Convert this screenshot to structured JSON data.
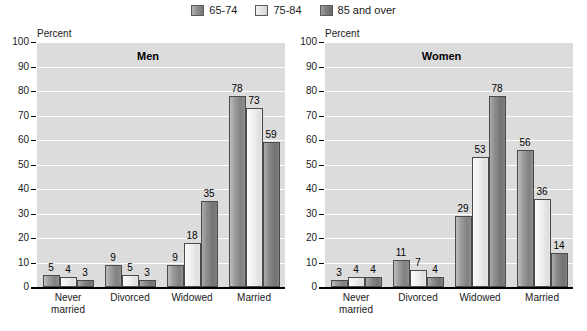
{
  "legend": {
    "items": [
      {
        "label": "65-74",
        "swatch": "legend-swatch-65-74",
        "color": "#8d8d8d"
      },
      {
        "label": "75-84",
        "swatch": "legend-swatch-75-84",
        "color": "#e2e2e2"
      },
      {
        "label": "85 and over",
        "swatch": "legend-swatch-85-and-over",
        "color": "#7d7d7d"
      }
    ]
  },
  "axis": {
    "ylabel": "Percent",
    "yticks": [
      "100",
      "90",
      "80",
      "70",
      "60",
      "50",
      "40",
      "30",
      "20",
      "10",
      "0"
    ]
  },
  "panels": [
    {
      "title": "Men",
      "categories": [
        "Never married",
        "Divorced",
        "Widowed",
        "Married"
      ]
    },
    {
      "title": "Women",
      "categories": [
        "Never married",
        "Divorced",
        "Widowed",
        "Married"
      ]
    }
  ],
  "chart_data": [
    {
      "type": "bar",
      "title": "Men",
      "xlabel": "",
      "ylabel": "Percent",
      "ylim": [
        0,
        100
      ],
      "ytick_step": 10,
      "grid": true,
      "legend_position": "top-center",
      "categories": [
        "Never married",
        "Divorced",
        "Widowed",
        "Married"
      ],
      "series": [
        {
          "name": "65-74",
          "values": [
            5,
            9,
            9,
            78
          ]
        },
        {
          "name": "75-84",
          "values": [
            4,
            5,
            18,
            73
          ]
        },
        {
          "name": "85 and over",
          "values": [
            3,
            3,
            35,
            59
          ]
        }
      ]
    },
    {
      "type": "bar",
      "title": "Women",
      "xlabel": "",
      "ylabel": "Percent",
      "ylim": [
        0,
        100
      ],
      "ytick_step": 10,
      "grid": true,
      "legend_position": "top-center",
      "categories": [
        "Never married",
        "Divorced",
        "Widowed",
        "Married"
      ],
      "series": [
        {
          "name": "65-74",
          "values": [
            3,
            11,
            29,
            56
          ]
        },
        {
          "name": "75-84",
          "values": [
            4,
            7,
            53,
            36
          ]
        },
        {
          "name": "85 and over",
          "values": [
            4,
            4,
            78,
            14
          ]
        }
      ]
    }
  ]
}
